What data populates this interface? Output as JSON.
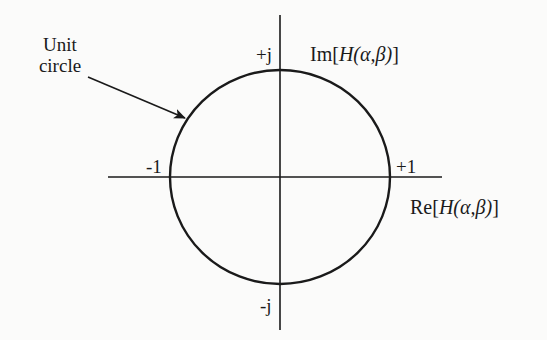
{
  "diagram": {
    "type": "complex-plane unit circle",
    "annotation": {
      "line1": "Unit",
      "line2": "circle"
    },
    "axes": {
      "imaginary": {
        "prefix": "Im[",
        "func": "H",
        "args": "(α,β)",
        "suffix": "]"
      },
      "real": {
        "prefix": "Re[",
        "func": "H",
        "args": "(α,β)",
        "suffix": "]"
      }
    },
    "ticks": {
      "plus_j": "+j",
      "minus_j": "-j",
      "plus_one": "+1",
      "minus_one": "-1"
    },
    "colors": {
      "ink": "#1a1a1a",
      "background": "#fbfbfa"
    }
  }
}
